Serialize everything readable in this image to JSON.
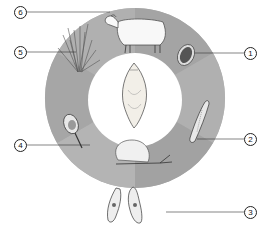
{
  "diagram": {
    "type": "life-cycle",
    "center": {
      "name": "adult-fluke"
    },
    "ring_colors": {
      "segment_a": "#a6a6a6",
      "segment_b": "#b2b2b2",
      "inner": "#ffffff"
    },
    "labels": [
      {
        "num": "1",
        "stage": "egg"
      },
      {
        "num": "2",
        "stage": "miracidium"
      },
      {
        "num": "3",
        "stage": "sporocyst-redia"
      },
      {
        "num": "4",
        "stage": "cercaria"
      },
      {
        "num": "5",
        "stage": "metacercaria-on-grass"
      },
      {
        "num": "6",
        "stage": "sheep-host"
      }
    ],
    "intermediate_host": "snail"
  }
}
